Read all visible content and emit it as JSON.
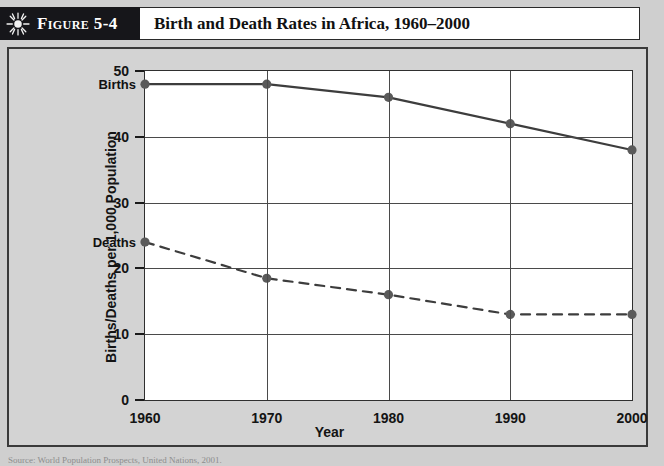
{
  "header": {
    "icon": "sun-starburst-icon",
    "figure_number": "Figure 5-4",
    "title": "Birth and Death Rates in Africa, 1960–2000"
  },
  "source_note": "Source: World Population Prospects, United Nations, 2001.",
  "colors": {
    "header_bar": "#16161a",
    "panel_background": "#d3d3d3",
    "plot_background": "#ffffff",
    "series_line": "#3d3d3d",
    "marker": "#5a5a5a",
    "grid": "#4a4a4a"
  },
  "chart_data": {
    "type": "line",
    "title": "Birth and Death Rates in Africa, 1960–2000",
    "xlabel": "Year",
    "ylabel": "Births/Deaths per 1,000 Population",
    "x": [
      1960,
      1970,
      1980,
      1990,
      2000
    ],
    "xtick_labels": [
      "1960",
      "1970",
      "1980",
      "1990",
      "2000"
    ],
    "ytick_labels": [
      "0",
      "10",
      "20",
      "30",
      "40",
      "50"
    ],
    "yticks": [
      0,
      10,
      20,
      30,
      40,
      50
    ],
    "ylim": [
      0,
      50
    ],
    "xlim": [
      1960,
      2000
    ],
    "grid": true,
    "legend_position": "inline-left",
    "series": [
      {
        "name": "Births",
        "label": "Births",
        "style": "solid",
        "values": [
          48,
          48,
          46,
          42,
          38
        ]
      },
      {
        "name": "Deaths",
        "label": "Deaths",
        "style": "dashed",
        "values": [
          24,
          18.5,
          16,
          13,
          13
        ]
      }
    ]
  }
}
